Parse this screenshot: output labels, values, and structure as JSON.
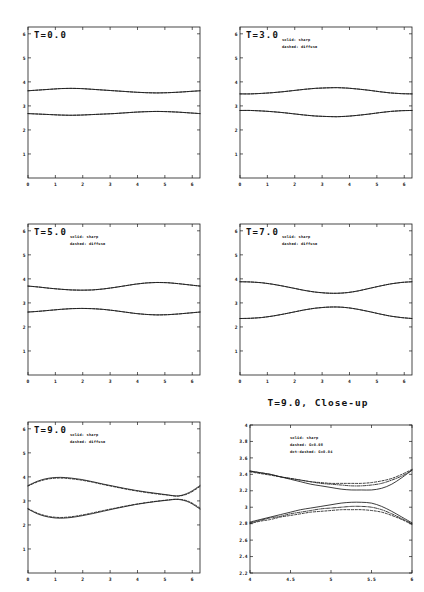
{
  "figure": {
    "background": "#ffffff",
    "ink": "#1a1a1a",
    "columns": 2,
    "rows": 3
  },
  "panels": [
    {
      "id": "t0",
      "label": "T=0.0",
      "title": "",
      "legend": [],
      "xticks": [
        "0",
        "1",
        "2",
        "3",
        "4",
        "5",
        "6"
      ],
      "yticks": [
        "1",
        "2",
        "3",
        "4",
        "5",
        "6"
      ]
    },
    {
      "id": "t3",
      "label": "T=3.0",
      "title": "",
      "legend": [
        "solid: sharp",
        "dashed: diffuse"
      ],
      "xticks": [
        "0",
        "1",
        "2",
        "3",
        "4",
        "5",
        "6"
      ],
      "yticks": [
        "1",
        "2",
        "3",
        "4",
        "5",
        "6"
      ]
    },
    {
      "id": "t5",
      "label": "T=5.0",
      "title": "",
      "legend": [
        "solid: sharp",
        "dashed: diffuse"
      ],
      "xticks": [
        "0",
        "1",
        "2",
        "3",
        "4",
        "5",
        "6"
      ],
      "yticks": [
        "1",
        "2",
        "3",
        "4",
        "5",
        "6"
      ]
    },
    {
      "id": "t7",
      "label": "T=7.0",
      "title": "",
      "legend": [
        "solid: sharp",
        "dashed: diffuse"
      ],
      "xticks": [
        "0",
        "1",
        "2",
        "3",
        "4",
        "5",
        "6"
      ],
      "yticks": [
        "1",
        "2",
        "3",
        "4",
        "5",
        "6"
      ]
    },
    {
      "id": "t9",
      "label": "T=9.0",
      "title": "",
      "legend": [
        "solid: sharp",
        "dashed: diffuse"
      ],
      "xticks": [
        "0",
        "1",
        "2",
        "3",
        "4",
        "5",
        "6"
      ],
      "yticks": [
        "1",
        "2",
        "3",
        "4",
        "5",
        "6"
      ]
    },
    {
      "id": "t9closeup",
      "label": "",
      "title": "T=9.0, Close-up",
      "legend": [
        "solid: sharp",
        "dashed: G=0.08",
        "dot-dashed: G=0.04"
      ],
      "xticks": [
        "4",
        "4.5",
        "5",
        "5.5",
        "6"
      ],
      "yticks": [
        "2.2",
        "2.4",
        "2.6",
        "2.8",
        "3",
        "3.2",
        "3.4",
        "3.6",
        "3.8",
        "4"
      ]
    }
  ],
  "chart_data": [
    {
      "type": "line",
      "panel": "t0",
      "title": "T=0.0",
      "xlabel": "",
      "ylabel": "",
      "xlim": [
        0,
        6.2832
      ],
      "ylim": [
        0,
        6.2832
      ],
      "grid": false,
      "legend_position": "none",
      "x": [
        0,
        0.3927,
        0.7854,
        1.1781,
        1.5708,
        1.9635,
        2.3562,
        2.7489,
        3.1416,
        3.5343,
        3.927,
        4.3197,
        4.7124,
        5.1051,
        5.4978,
        5.8905,
        6.2832
      ],
      "series": [
        {
          "name": "upper sharp",
          "style": "solid",
          "values": [
            3.63,
            3.66,
            3.69,
            3.72,
            3.73,
            3.72,
            3.69,
            3.66,
            3.63,
            3.6,
            3.57,
            3.55,
            3.54,
            3.55,
            3.57,
            3.6,
            3.63
          ]
        },
        {
          "name": "upper diffuse",
          "style": "dashed",
          "values": [
            3.63,
            3.66,
            3.69,
            3.72,
            3.73,
            3.72,
            3.69,
            3.66,
            3.63,
            3.6,
            3.57,
            3.55,
            3.54,
            3.55,
            3.57,
            3.6,
            3.63
          ]
        },
        {
          "name": "lower sharp",
          "style": "solid",
          "values": [
            2.68,
            2.66,
            2.64,
            2.62,
            2.61,
            2.62,
            2.64,
            2.66,
            2.68,
            2.71,
            2.74,
            2.76,
            2.77,
            2.76,
            2.74,
            2.71,
            2.68
          ]
        },
        {
          "name": "lower diffuse",
          "style": "dashed",
          "values": [
            2.68,
            2.66,
            2.64,
            2.62,
            2.61,
            2.62,
            2.64,
            2.66,
            2.68,
            2.71,
            2.74,
            2.76,
            2.77,
            2.76,
            2.74,
            2.71,
            2.68
          ]
        }
      ]
    },
    {
      "type": "line",
      "panel": "t3",
      "title": "T=3.0",
      "xlabel": "",
      "ylabel": "",
      "xlim": [
        0,
        6.2832
      ],
      "ylim": [
        0,
        6.2832
      ],
      "grid": false,
      "legend_position": "upper-center",
      "x": [
        0,
        0.3927,
        0.7854,
        1.1781,
        1.5708,
        1.9635,
        2.3562,
        2.7489,
        3.1416,
        3.5343,
        3.927,
        4.3197,
        4.7124,
        5.1051,
        5.4978,
        5.8905,
        6.2832
      ],
      "series": [
        {
          "name": "upper sharp",
          "style": "solid",
          "values": [
            3.5,
            3.5,
            3.52,
            3.55,
            3.59,
            3.64,
            3.69,
            3.73,
            3.75,
            3.76,
            3.74,
            3.7,
            3.65,
            3.59,
            3.54,
            3.51,
            3.5
          ]
        },
        {
          "name": "upper diffuse",
          "style": "dashed",
          "values": [
            3.5,
            3.5,
            3.52,
            3.55,
            3.59,
            3.64,
            3.69,
            3.73,
            3.75,
            3.76,
            3.74,
            3.7,
            3.65,
            3.59,
            3.54,
            3.51,
            3.5
          ]
        },
        {
          "name": "lower sharp",
          "style": "solid",
          "values": [
            2.81,
            2.81,
            2.79,
            2.76,
            2.72,
            2.67,
            2.62,
            2.58,
            2.56,
            2.55,
            2.57,
            2.61,
            2.66,
            2.72,
            2.77,
            2.8,
            2.81
          ]
        },
        {
          "name": "lower diffuse",
          "style": "dashed",
          "values": [
            2.81,
            2.81,
            2.79,
            2.76,
            2.72,
            2.67,
            2.62,
            2.58,
            2.56,
            2.55,
            2.57,
            2.61,
            2.66,
            2.72,
            2.77,
            2.8,
            2.81
          ]
        }
      ]
    },
    {
      "type": "line",
      "panel": "t5",
      "title": "T=5.0",
      "xlabel": "",
      "ylabel": "",
      "xlim": [
        0,
        6.2832
      ],
      "ylim": [
        0,
        6.2832
      ],
      "grid": false,
      "legend_position": "upper-center",
      "x": [
        0,
        0.3927,
        0.7854,
        1.1781,
        1.5708,
        1.9635,
        2.3562,
        2.7489,
        3.1416,
        3.5343,
        3.927,
        4.3197,
        4.7124,
        5.1051,
        5.4978,
        5.8905,
        6.2832
      ],
      "series": [
        {
          "name": "upper sharp",
          "style": "solid",
          "values": [
            3.7,
            3.66,
            3.61,
            3.57,
            3.54,
            3.53,
            3.54,
            3.58,
            3.64,
            3.71,
            3.78,
            3.83,
            3.85,
            3.84,
            3.8,
            3.75,
            3.7
          ]
        },
        {
          "name": "upper diffuse",
          "style": "dashed",
          "values": [
            3.7,
            3.66,
            3.61,
            3.57,
            3.54,
            3.53,
            3.54,
            3.58,
            3.64,
            3.71,
            3.78,
            3.83,
            3.85,
            3.84,
            3.8,
            3.75,
            3.7
          ]
        },
        {
          "name": "lower sharp",
          "style": "solid",
          "values": [
            2.62,
            2.65,
            2.69,
            2.73,
            2.76,
            2.77,
            2.76,
            2.73,
            2.68,
            2.62,
            2.56,
            2.52,
            2.5,
            2.51,
            2.54,
            2.58,
            2.62
          ]
        },
        {
          "name": "lower diffuse",
          "style": "dashed",
          "values": [
            2.62,
            2.65,
            2.69,
            2.73,
            2.76,
            2.77,
            2.76,
            2.73,
            2.68,
            2.62,
            2.56,
            2.52,
            2.5,
            2.51,
            2.54,
            2.58,
            2.62
          ]
        }
      ]
    },
    {
      "type": "line",
      "panel": "t7",
      "title": "T=7.0",
      "xlabel": "",
      "ylabel": "",
      "xlim": [
        0,
        6.2832
      ],
      "ylim": [
        0,
        6.2832
      ],
      "grid": false,
      "legend_position": "upper-center",
      "x": [
        0,
        0.3927,
        0.7854,
        1.1781,
        1.5708,
        1.9635,
        2.3562,
        2.7489,
        3.1416,
        3.5343,
        3.927,
        4.3197,
        4.7124,
        5.1051,
        5.4978,
        5.8905,
        6.2832
      ],
      "series": [
        {
          "name": "upper sharp",
          "style": "solid",
          "values": [
            3.88,
            3.87,
            3.84,
            3.78,
            3.7,
            3.61,
            3.52,
            3.45,
            3.41,
            3.4,
            3.43,
            3.5,
            3.6,
            3.7,
            3.79,
            3.85,
            3.88
          ]
        },
        {
          "name": "upper diffuse",
          "style": "dashed",
          "values": [
            3.88,
            3.87,
            3.84,
            3.78,
            3.7,
            3.61,
            3.52,
            3.45,
            3.41,
            3.4,
            3.43,
            3.5,
            3.6,
            3.7,
            3.79,
            3.85,
            3.88
          ]
        },
        {
          "name": "lower sharp",
          "style": "solid",
          "values": [
            2.35,
            2.36,
            2.39,
            2.45,
            2.53,
            2.62,
            2.71,
            2.78,
            2.82,
            2.83,
            2.8,
            2.73,
            2.64,
            2.54,
            2.45,
            2.39,
            2.35
          ]
        },
        {
          "name": "lower diffuse",
          "style": "dashed",
          "values": [
            2.35,
            2.36,
            2.39,
            2.45,
            2.53,
            2.62,
            2.71,
            2.78,
            2.82,
            2.83,
            2.8,
            2.73,
            2.64,
            2.54,
            2.45,
            2.39,
            2.35
          ]
        }
      ]
    },
    {
      "type": "line",
      "panel": "t9",
      "title": "T=9.0",
      "xlabel": "",
      "ylabel": "",
      "xlim": [
        0,
        6.2832
      ],
      "ylim": [
        0,
        6.2832
      ],
      "grid": false,
      "legend_position": "upper-center",
      "x": [
        0,
        0.3927,
        0.7854,
        1.1781,
        1.5708,
        1.9635,
        2.3562,
        2.7489,
        3.1416,
        3.5343,
        3.927,
        4.3197,
        4.7124,
        5.1051,
        5.4978,
        5.8905,
        6.2832
      ],
      "series": [
        {
          "name": "upper sharp",
          "style": "solid",
          "values": [
            3.64,
            3.84,
            3.95,
            3.98,
            3.95,
            3.89,
            3.8,
            3.7,
            3.61,
            3.52,
            3.44,
            3.37,
            3.31,
            3.25,
            3.21,
            3.35,
            3.64
          ]
        },
        {
          "name": "upper diffuse",
          "style": "dashed",
          "values": [
            3.62,
            3.81,
            3.92,
            3.95,
            3.92,
            3.86,
            3.78,
            3.68,
            3.59,
            3.5,
            3.42,
            3.35,
            3.29,
            3.24,
            3.2,
            3.32,
            3.6
          ]
        },
        {
          "name": "lower sharp",
          "style": "solid",
          "values": [
            2.66,
            2.44,
            2.32,
            2.28,
            2.31,
            2.38,
            2.47,
            2.57,
            2.67,
            2.76,
            2.85,
            2.92,
            2.98,
            3.03,
            3.06,
            2.94,
            2.66
          ]
        },
        {
          "name": "lower diffuse",
          "style": "dashed",
          "values": [
            2.68,
            2.47,
            2.35,
            2.31,
            2.34,
            2.41,
            2.5,
            2.6,
            2.69,
            2.78,
            2.86,
            2.93,
            2.99,
            3.04,
            3.07,
            2.97,
            2.7
          ]
        }
      ]
    },
    {
      "type": "line",
      "panel": "t9closeup",
      "title": "T=9.0, Close-up",
      "xlabel": "",
      "ylabel": "",
      "xlim": [
        4,
        6
      ],
      "ylim": [
        2.2,
        4.0
      ],
      "grid": false,
      "legend_position": "upper-center",
      "x": [
        4.0,
        4.125,
        4.25,
        4.375,
        4.5,
        4.625,
        4.75,
        4.875,
        5.0,
        5.125,
        5.25,
        5.375,
        5.5,
        5.625,
        5.75,
        5.875,
        6.0
      ],
      "series": [
        {
          "name": "upper sharp",
          "style": "solid",
          "values": [
            3.44,
            3.42,
            3.4,
            3.37,
            3.34,
            3.31,
            3.28,
            3.26,
            3.24,
            3.22,
            3.21,
            3.21,
            3.21,
            3.23,
            3.28,
            3.36,
            3.45
          ]
        },
        {
          "name": "upper dashed G=0.08",
          "style": "dashed",
          "values": [
            3.43,
            3.41,
            3.39,
            3.37,
            3.35,
            3.33,
            3.31,
            3.3,
            3.29,
            3.29,
            3.29,
            3.29,
            3.3,
            3.32,
            3.35,
            3.4,
            3.46
          ]
        },
        {
          "name": "upper dot-dashed G=0.04",
          "style": "dotdash",
          "values": [
            3.44,
            3.42,
            3.4,
            3.37,
            3.35,
            3.33,
            3.31,
            3.29,
            3.28,
            3.27,
            3.26,
            3.26,
            3.27,
            3.29,
            3.33,
            3.38,
            3.45
          ]
        },
        {
          "name": "lower sharp",
          "style": "solid",
          "values": [
            2.82,
            2.85,
            2.88,
            2.91,
            2.94,
            2.97,
            2.99,
            3.01,
            3.03,
            3.05,
            3.06,
            3.06,
            3.05,
            3.01,
            2.95,
            2.88,
            2.81
          ]
        },
        {
          "name": "lower dashed G=0.08",
          "style": "dashed",
          "values": [
            2.8,
            2.83,
            2.85,
            2.88,
            2.9,
            2.92,
            2.94,
            2.95,
            2.96,
            2.97,
            2.97,
            2.97,
            2.96,
            2.94,
            2.9,
            2.85,
            2.79
          ]
        },
        {
          "name": "lower dot-dashed G=0.04",
          "style": "dotdash",
          "values": [
            2.81,
            2.84,
            2.87,
            2.89,
            2.92,
            2.94,
            2.96,
            2.98,
            2.99,
            3.0,
            3.01,
            3.01,
            3.0,
            2.97,
            2.92,
            2.86,
            2.8
          ]
        }
      ]
    }
  ]
}
